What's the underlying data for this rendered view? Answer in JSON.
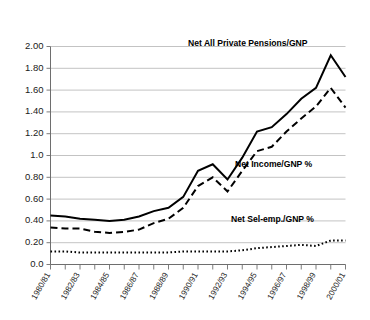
{
  "chart_data": {
    "type": "line",
    "title": "",
    "xlabel": "",
    "ylabel": "",
    "ylim": [
      0.0,
      2.0
    ],
    "grid": true,
    "legend_position": "inline-annotations",
    "categories": [
      "1980/81",
      "1981/82",
      "1982/83",
      "1983/84",
      "1984/85",
      "1985/86",
      "1986/87",
      "1987/88",
      "1988/89",
      "1989/90",
      "1990/91",
      "1991/92",
      "1992/93",
      "1993/94",
      "1994/95",
      "1995/96",
      "1996/97",
      "1997/98",
      "1998/99",
      "1999/00",
      "2000/01"
    ],
    "xtick_labels": [
      "1980/81",
      "1982/83",
      "1984/85",
      "1986/87",
      "1988/89",
      "1990/91",
      "1992/93",
      "1994/95",
      "1996/97",
      "1998/99",
      "2000/01"
    ],
    "ytick_labels": [
      "0.0",
      "0.20",
      "0.40",
      "0.60",
      "0.80",
      "1.0",
      "1.20",
      "1.40",
      "1.60",
      "1.80",
      "2.00"
    ],
    "ytick_values": [
      0.0,
      0.2,
      0.4,
      0.6,
      0.8,
      1.0,
      1.2,
      1.4,
      1.6,
      1.8,
      2.0
    ],
    "series": [
      {
        "name": "Net All Private Pensions/GNP",
        "style": "solid",
        "color": "#000000",
        "values": [
          0.45,
          0.44,
          0.42,
          0.41,
          0.4,
          0.41,
          0.44,
          0.49,
          0.52,
          0.62,
          0.86,
          0.92,
          0.78,
          0.98,
          1.22,
          1.26,
          1.38,
          1.52,
          1.62,
          1.92,
          1.72
        ]
      },
      {
        "name": "Net Income/GNP %",
        "style": "dashed",
        "color": "#000000",
        "values": [
          0.34,
          0.33,
          0.33,
          0.3,
          0.29,
          0.3,
          0.32,
          0.38,
          0.42,
          0.52,
          0.72,
          0.8,
          0.67,
          0.86,
          1.04,
          1.08,
          1.22,
          1.34,
          1.45,
          1.62,
          1.44
        ]
      },
      {
        "name": "Net Sel-emp./GNP %",
        "style": "dotted",
        "color": "#000000",
        "values": [
          0.12,
          0.12,
          0.11,
          0.11,
          0.11,
          0.11,
          0.11,
          0.11,
          0.11,
          0.12,
          0.12,
          0.12,
          0.12,
          0.13,
          0.15,
          0.16,
          0.17,
          0.18,
          0.17,
          0.22,
          0.22
        ]
      }
    ],
    "annotations": [
      {
        "text": "Net All Private Pensions/GNP",
        "x": 188,
        "y": 46
      },
      {
        "text": "Net Income/GNP %",
        "x": 235,
        "y": 167
      },
      {
        "text": "Net Sel-emp./GNP %",
        "x": 231,
        "y": 222
      }
    ]
  }
}
